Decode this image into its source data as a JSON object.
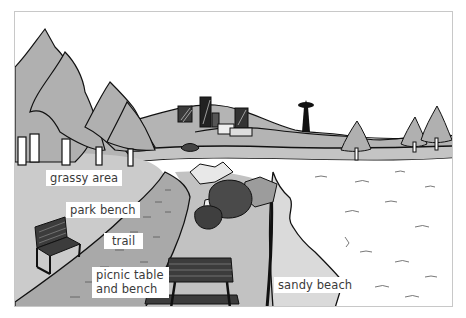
{
  "illustration": {
    "subject": "park scene with trail, benches, trees, city skyline and sandy beach",
    "colors": {
      "sky": "#ffffff",
      "grass": "#c8c8c8",
      "hill": "#b4b4b4",
      "trail": "#a8a8a8",
      "tree": "#b0b0b0",
      "bench": "#3c3c3c",
      "bush": "#4a4a4a",
      "rock": "#9a9a9a",
      "beach": "#d8d8d8",
      "water": "#ffffff",
      "outline": "#111111",
      "frame_border": "#c8c8c8"
    }
  },
  "labels": {
    "grassy_area": "grassy area",
    "park_bench": "park bench",
    "trail": "trail",
    "picnic_table_line1": "picnic table",
    "picnic_table_line2": "and bench",
    "sandy_beach": "sandy beach"
  }
}
